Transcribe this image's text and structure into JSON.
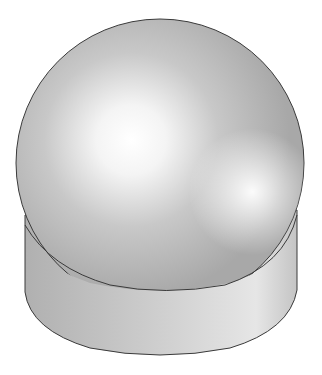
{
  "figure": {
    "colors": {
      "background": "#ffffff",
      "surface_base": "#b4b4b4",
      "highlight": "#ffffff",
      "outline": "#3a3a3a"
    },
    "shapes": [
      {
        "name": "sphere",
        "cx": 160,
        "cy": 163,
        "r": 144
      },
      {
        "name": "cylinder",
        "left_x": 25,
        "right_x": 297,
        "top_y": 215,
        "bottom_y": 357
      }
    ]
  }
}
